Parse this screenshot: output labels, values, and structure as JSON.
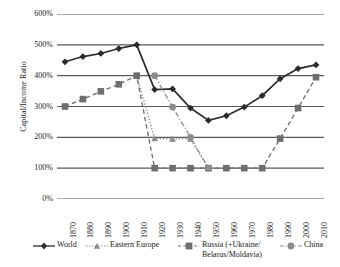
{
  "chart_data": {
    "type": "line",
    "title": "",
    "xlabel": "",
    "ylabel": "Capital/Income Ratio",
    "x": [
      1870,
      1880,
      1890,
      1900,
      1910,
      1920,
      1930,
      1940,
      1950,
      1960,
      1970,
      1980,
      1990,
      2000,
      2010
    ],
    "xtick_labels": [
      "1870",
      "1880",
      "1890",
      "1900",
      "1910",
      "1920",
      "1930",
      "1940",
      "1950",
      "1960",
      "1970",
      "1980",
      "1990",
      "2000",
      "2010"
    ],
    "ytick_labels": [
      "0%",
      "100%",
      "200%",
      "300%",
      "400%",
      "500%",
      "600%"
    ],
    "ytick_values": [
      0,
      100,
      200,
      300,
      400,
      500,
      600
    ],
    "ylim": [
      0,
      600
    ],
    "grid": "horizontal",
    "legend_position": "bottom",
    "series": [
      {
        "name": "World",
        "marker": "diamond",
        "linestyle": "solid",
        "color": "#2b2b2b",
        "x": [
          1870,
          1880,
          1890,
          1900,
          1910,
          1920,
          1930,
          1940,
          1950,
          1960,
          1970,
          1980,
          1990,
          2000,
          2010
        ],
        "values": [
          445,
          462,
          472,
          488,
          500,
          355,
          357,
          295,
          255,
          270,
          298,
          335,
          390,
          423,
          435
        ]
      },
      {
        "name": "Eastern Europe",
        "marker": "triangle",
        "linestyle": "dotted",
        "color": "#8c8c8c",
        "x": [
          1910,
          1920,
          1930,
          1940,
          1950
        ],
        "values": [
          400,
          196,
          195,
          195,
          100
        ]
      },
      {
        "name": "Russia (+Ukraine/Belarus/Moldavia)",
        "marker": "square",
        "linestyle": "dashed",
        "color": "#6e6e6e",
        "x": [
          1870,
          1880,
          1890,
          1900,
          1910,
          1920,
          1930,
          1940,
          1950,
          1960,
          1970,
          1980,
          1990,
          2000,
          2010
        ],
        "values": [
          300,
          324,
          349,
          372,
          400,
          100,
          100,
          100,
          100,
          100,
          100,
          100,
          196,
          295,
          395
        ]
      },
      {
        "name": "China",
        "marker": "circle",
        "linestyle": "dashdot",
        "color": "#8c8c8c",
        "x": [
          1920,
          1930,
          1940,
          1950
        ],
        "values": [
          400,
          298,
          200,
          100
        ]
      }
    ]
  },
  "legend": {
    "items": [
      {
        "label": "World",
        "marker": "diamond-marker-icon"
      },
      {
        "label": "Eastern Europe",
        "marker": "triangle-marker-icon"
      },
      {
        "label": "Russia (+Ukraine/ Belarus/Moldavia)",
        "marker": "square-marker-icon"
      },
      {
        "label": "China",
        "marker": "circle-marker-icon"
      }
    ]
  },
  "colors": {
    "world": "#2b2b2b",
    "eastern_europe": "#8c8c8c",
    "russia": "#6e6e6e",
    "china": "#8c8c8c",
    "gridline": "#595959",
    "text": "#1a1a1a"
  }
}
